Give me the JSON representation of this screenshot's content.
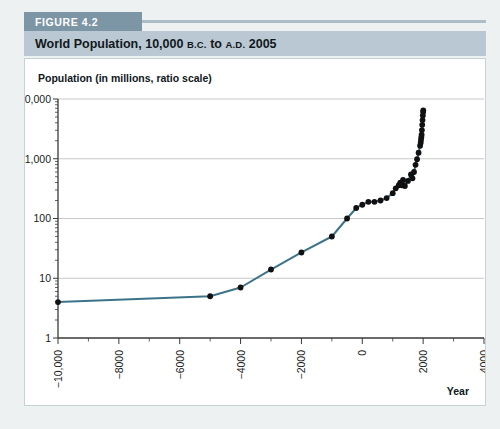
{
  "figure": {
    "tab_label": "FIGURE 4.2",
    "title_main_1": "World Population, 10,000 ",
    "title_bc": "B.C.",
    "title_main_2": " to ",
    "title_ad": "A.D.",
    "title_main_3": " 2005"
  },
  "colors": {
    "tab_bg": "#7d96a6",
    "title_bg": "#b9c8d2",
    "page_bg": "#eef1f2",
    "panel_bg": "#ffffff",
    "line": "#3d7389",
    "marker": "#111111",
    "gridline": "#c8c8c8",
    "axis": "#3a3a3a"
  },
  "chart_data": {
    "type": "line",
    "title": "World Population, 10,000 B.C. to A.D. 2005",
    "ylabel": "Population (in millions, ratio scale)",
    "xlabel": "Year",
    "yscale": "log",
    "ylim": [
      1,
      10000
    ],
    "xlim": [
      -10000,
      4000
    ],
    "grid": true,
    "legend": null,
    "y_ticks": [
      1,
      10,
      100,
      1000,
      10000
    ],
    "y_ticklabels": [
      "1",
      "10",
      "100",
      "1,000",
      "10,000"
    ],
    "x_ticks": [
      -10000,
      -8000,
      -6000,
      -4000,
      -2000,
      0,
      2000,
      4000
    ],
    "x_ticklabels": [
      "−10,000",
      "−8000",
      "−6000",
      "−4000",
      "−2000",
      "0",
      "2000",
      "4000"
    ],
    "x_minor_interval": 1000,
    "series": [
      {
        "name": "World population",
        "x": [
          -10000,
          -5000,
          -4000,
          -3000,
          -2000,
          -1000,
          -500,
          -200,
          0,
          200,
          400,
          600,
          800,
          1000,
          1100,
          1200,
          1250,
          1300,
          1340,
          1400,
          1500,
          1600,
          1650,
          1700,
          1750,
          1800,
          1850,
          1900,
          1920,
          1930,
          1940,
          1950,
          1960,
          1970,
          1980,
          1990,
          2000,
          2005
        ],
        "y": [
          4,
          5,
          7,
          14,
          27,
          50,
          100,
          150,
          170,
          190,
          190,
          200,
          220,
          265,
          320,
          360,
          400,
          360,
          443,
          350,
          425,
          545,
          470,
          600,
          790,
          980,
          1260,
          1650,
          1860,
          2070,
          2300,
          2520,
          3020,
          3700,
          4440,
          5270,
          6080,
          6450
        ]
      }
    ]
  }
}
